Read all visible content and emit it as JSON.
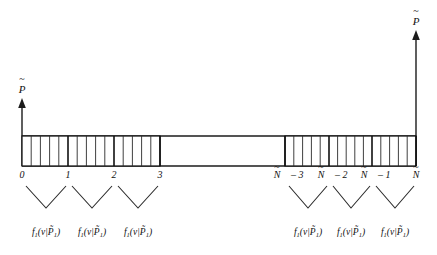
{
  "figure": {
    "type": "axis-partition-diagram",
    "background_color": "#ffffff",
    "ink_color": "#111111"
  },
  "axes": {
    "left_axis": {
      "label": "P̃",
      "label_base": "P",
      "accent": "~",
      "name": "left-vertical-axis",
      "x": 22,
      "top_y": 100,
      "bottom_y": 166,
      "has_arrow": true
    },
    "right_axis": {
      "label": "P̃",
      "label_base": "P",
      "accent": "~",
      "name": "right-vertical-axis",
      "x": 416,
      "top_y": 32,
      "bottom_y": 166,
      "has_arrow": true
    },
    "horizontal": {
      "name": "baseline-axis",
      "y_top": 136,
      "y_bottom": 166,
      "x_start": 22,
      "x_end": 416
    }
  },
  "ticks": {
    "left_group": [
      {
        "label": "0",
        "x": 22
      },
      {
        "label": "1",
        "x": 68
      },
      {
        "label": "2",
        "x": 114
      },
      {
        "label": "3",
        "x": 160
      }
    ],
    "right_group": [
      {
        "label": "Ñ – 3",
        "base": "N",
        "suffix": " – 3",
        "x": 285
      },
      {
        "label": "Ñ – 2",
        "base": "N",
        "suffix": " – 2",
        "x": 329
      },
      {
        "label": "Ñ – 1",
        "base": "N",
        "suffix": " – 1",
        "x": 372
      },
      {
        "label": "Ñ",
        "base": "N",
        "suffix": "",
        "x": 416
      }
    ]
  },
  "hatched_regions": [
    {
      "name": "left-hatched-block",
      "x_start": 22,
      "x_end": 160,
      "divisions_per_unit": 5,
      "units": 3
    },
    {
      "name": "right-hatched-block",
      "x_start": 285,
      "x_end": 416,
      "divisions_per_unit": 5,
      "units": 3
    }
  ],
  "gap_region": {
    "name": "ellipsis-gap",
    "x_start": 160,
    "x_end": 285
  },
  "braces": [
    {
      "name": "brace-interval-0-1",
      "left_x": 26,
      "right_x": 66,
      "apex_x": 46,
      "top_y": 186,
      "apex_y": 208
    },
    {
      "name": "brace-interval-1-2",
      "left_x": 72,
      "right_x": 112,
      "apex_x": 92,
      "top_y": 186,
      "apex_y": 208
    },
    {
      "name": "brace-interval-2-3",
      "left_x": 118,
      "right_x": 158,
      "apex_x": 138,
      "top_y": 186,
      "apex_y": 208
    },
    {
      "name": "brace-interval-n3-n2",
      "left_x": 289,
      "right_x": 327,
      "apex_x": 308,
      "top_y": 186,
      "apex_y": 208
    },
    {
      "name": "brace-interval-n2-n1",
      "left_x": 333,
      "right_x": 370,
      "apex_x": 351,
      "top_y": 186,
      "apex_y": 208
    },
    {
      "name": "brace-interval-n1-n",
      "left_x": 376,
      "right_x": 414,
      "apex_x": 395,
      "top_y": 186,
      "apex_y": 208
    }
  ],
  "formulas": [
    {
      "name": "formula-1",
      "x": 46,
      "y": 232,
      "f": "f",
      "f_sub": "1",
      "open": "(",
      "v": "v",
      "bar": "|",
      "p": "P̃",
      "p_sub": "1",
      "close": ")",
      "text": "f₁(v|P̃₁)"
    },
    {
      "name": "formula-2",
      "x": 92,
      "y": 232,
      "f": "f",
      "f_sub": "1",
      "open": "(",
      "v": "v",
      "bar": "|",
      "p": "P̃",
      "p_sub": "1",
      "close": ")",
      "text": "f₁(v|P̃₁)"
    },
    {
      "name": "formula-3",
      "x": 138,
      "y": 232,
      "f": "f",
      "f_sub": "1",
      "open": "(",
      "v": "v",
      "bar": "|",
      "p": "P̃",
      "p_sub": "1",
      "close": ")",
      "text": "f₁(v|P̃₁)"
    },
    {
      "name": "formula-4",
      "x": 308,
      "y": 232,
      "f": "f",
      "f_sub": "1",
      "open": "(",
      "v": "v",
      "bar": "|",
      "p": "P̃",
      "p_sub": "1",
      "close": ")",
      "text": "f₁(v|P̃₁)"
    },
    {
      "name": "formula-5",
      "x": 351,
      "y": 232,
      "f": "f",
      "f_sub": "1",
      "open": "(",
      "v": "v",
      "bar": "|",
      "p": "P̃",
      "p_sub": "1",
      "close": ")",
      "text": "f₁(v|P̃₁)"
    },
    {
      "name": "formula-6",
      "x": 395,
      "y": 232,
      "f": "f",
      "f_sub": "1",
      "open": "(",
      "v": "v",
      "bar": "|",
      "p": "P̃",
      "p_sub": "1",
      "close": ")",
      "text": "f₁(v|P̃₁)"
    }
  ]
}
